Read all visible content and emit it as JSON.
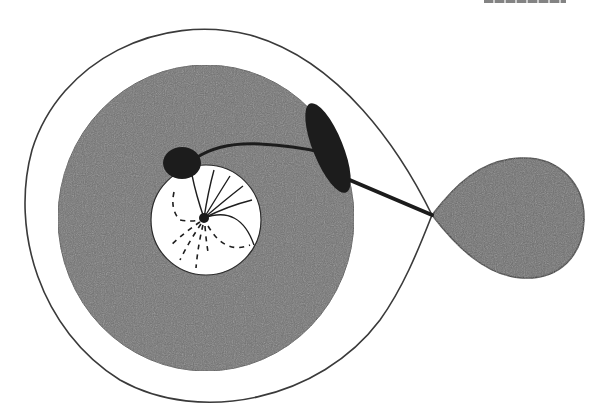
{
  "figure": {
    "type": "schematic",
    "caption_clipped": true,
    "colors": {
      "background": "#ffffff",
      "stroke": "#2b2b2b",
      "gray_fill": "#707070",
      "dark_fill": "#1c1c1c",
      "inner_fill": "#ffffff"
    },
    "elements": {
      "outer_boundary": {
        "shape": "teardrop",
        "cusp": [
          432,
          215
        ]
      },
      "gray_disk": {
        "cx": 206,
        "cy": 218,
        "rx": 148,
        "ry": 153
      },
      "inner_white_disk": {
        "cx": 206,
        "cy": 220,
        "r": 55
      },
      "center_dot": {
        "cx": 204,
        "cy": 218,
        "r": 5
      },
      "dark_blob": {
        "cx": 182,
        "cy": 163,
        "rx": 19,
        "ry": 16
      },
      "dark_capsule": {
        "cx": 328,
        "cy": 148,
        "rx": 16,
        "ry": 48,
        "rotate": -22
      },
      "right_lobe": {
        "cx": 524,
        "cy": 218,
        "r": 60
      },
      "radial_solid_lines": 6,
      "radial_dashed_lines": 6,
      "connector_curve": "blob-to-capsule",
      "connector_line": "capsule-to-cusp"
    }
  }
}
